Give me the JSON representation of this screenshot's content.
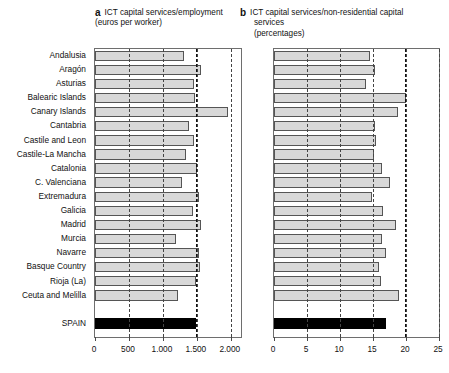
{
  "figure": {
    "panels": [
      {
        "letter": "a",
        "title_lines": [
          "ICT capital services/employment",
          "(euros per worker)"
        ]
      },
      {
        "letter": "b",
        "title_lines": [
          "ICT capital services/non-residential capital",
          "services",
          "(percentages)"
        ]
      }
    ]
  },
  "categories": [
    "Andalusia",
    "Aragón",
    "Asturias",
    "Balearic Islands",
    "Canary Islands",
    "Cantabria",
    "Castile and Leon",
    "Castile-La Mancha",
    "Catalonia",
    "C. Valenciana",
    "Extremadura",
    "Galicia",
    "Madrid",
    "Murcia",
    "Navarre",
    "Basque Country",
    "Rioja (La)",
    "Ceuta and Melilla"
  ],
  "total_label": "SPAIN",
  "chart_data": [
    {
      "type": "bar",
      "panel": "a",
      "title": "ICT capital services/employment (euros per worker)",
      "xlabel": "",
      "ylabel": "",
      "orientation": "horizontal",
      "xlim": [
        0,
        2150
      ],
      "xticks": [
        0,
        500,
        1000,
        1500,
        2000
      ],
      "xticklabels": [
        "0",
        "500",
        "1.000",
        "1.500",
        "2.000"
      ],
      "grid": "vertical-dashed",
      "reference_line": 1480,
      "categories": [
        "Andalusia",
        "Aragón",
        "Asturias",
        "Balearic Islands",
        "Canary Islands",
        "Cantabria",
        "Castile and Leon",
        "Castile-La Mancha",
        "Catalonia",
        "C. Valenciana",
        "Extremadura",
        "Galicia",
        "Madrid",
        "Murcia",
        "Navarre",
        "Basque Country",
        "Rioja (La)",
        "Ceuta and Melilla"
      ],
      "values": [
        1310,
        1555,
        1460,
        1470,
        1965,
        1390,
        1465,
        1345,
        1495,
        1275,
        1535,
        1440,
        1560,
        1190,
        1530,
        1545,
        1490,
        1215
      ],
      "total": {
        "label": "SPAIN",
        "value": 1480,
        "color": "#000000"
      }
    },
    {
      "type": "bar",
      "panel": "b",
      "title": "ICT capital services/non-residential capital services (percentages)",
      "xlabel": "",
      "ylabel": "",
      "orientation": "horizontal",
      "xlim": [
        0,
        25
      ],
      "xticks": [
        0,
        5,
        10,
        15,
        20,
        25
      ],
      "xticklabels": [
        "0",
        "5",
        "10",
        "15",
        "20",
        "25"
      ],
      "grid": "vertical-dashed",
      "reference_line": 19.8,
      "categories": [
        "Andalusia",
        "Aragón",
        "Asturias",
        "Balearic Islands",
        "Canary Islands",
        "Cantabria",
        "Castile and Leon",
        "Castile-La Mancha",
        "Catalonia",
        "C. Valenciana",
        "Extremadura",
        "Galicia",
        "Madrid",
        "Murcia",
        "Navarre",
        "Basque Country",
        "Rioja (La)",
        "Ceuta and Melilla"
      ],
      "values": [
        14.5,
        15.3,
        14.0,
        20.0,
        18.8,
        15.3,
        15.4,
        15.2,
        16.4,
        17.6,
        14.9,
        16.5,
        18.5,
        16.3,
        17.0,
        15.9,
        16.2,
        18.9
      ],
      "total": {
        "label": "SPAIN",
        "value": 17.0,
        "color": "#000000"
      }
    }
  ],
  "style": {
    "bar_fill": "#d8d8d8",
    "bar_stroke": "#555555",
    "total_fill": "#000000",
    "axis_color": "#6e6e6e",
    "grid_color": "#444444"
  }
}
